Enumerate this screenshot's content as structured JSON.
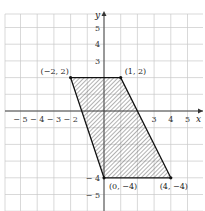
{
  "chart_data": {
    "type": "scatter",
    "title": "",
    "xlabel": "x",
    "ylabel": "y",
    "xlim": [
      -6,
      6
    ],
    "ylim": [
      -6,
      6
    ],
    "grid": true,
    "x_ticks": [
      "-5",
      "-4",
      "-3",
      "-2",
      "3",
      "4",
      "5"
    ],
    "y_ticks": [
      "5",
      "4",
      "3",
      "-4",
      "-5"
    ],
    "shape": "parallelogram",
    "fill": "hatched",
    "vertices": [
      {
        "x": -2,
        "y": 2,
        "label": "(−2, 2)"
      },
      {
        "x": 1,
        "y": 2,
        "label": "(1, 2)"
      },
      {
        "x": 4,
        "y": -4,
        "label": "(4, −4)"
      },
      {
        "x": 0,
        "y": -4,
        "label": "(0, −4)"
      }
    ]
  },
  "colors": {
    "grid": "#c8c8c8",
    "axis": "#333333",
    "edge": "#111111",
    "hatch": "#555555"
  }
}
